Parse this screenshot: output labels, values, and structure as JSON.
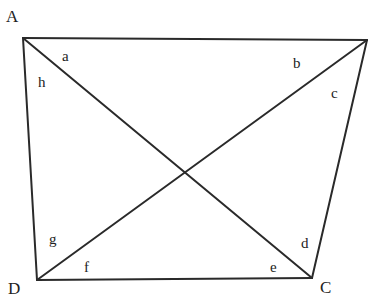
{
  "diagram": {
    "type": "quadrilateral-with-diagonals",
    "vertices": [
      {
        "name": "A",
        "x": 23,
        "y": 38,
        "label_x": 6,
        "label_y": 22
      },
      {
        "name": "B",
        "x": 367,
        "y": 40
      },
      {
        "name": "C",
        "x": 312,
        "y": 278,
        "label_x": 320,
        "label_y": 292
      },
      {
        "name": "D",
        "x": 37,
        "y": 280,
        "label_x": 10,
        "label_y": 293
      }
    ],
    "vertex_labels": {
      "A": "A",
      "C": "C",
      "D": "D"
    },
    "angle_labels": {
      "a": {
        "text": "a",
        "x": 62,
        "y": 61
      },
      "b": {
        "text": "b",
        "x": 295,
        "y": 68
      },
      "c": {
        "text": "c",
        "x": 331,
        "y": 98
      },
      "d": {
        "text": "d",
        "x": 301,
        "y": 248
      },
      "e": {
        "text": "e",
        "x": 271,
        "y": 272
      },
      "f": {
        "text": "f",
        "x": 84,
        "y": 271
      },
      "g": {
        "text": "g",
        "x": 49,
        "y": 244
      },
      "h": {
        "text": "h",
        "x": 39,
        "y": 86
      }
    },
    "stroke_color": "#2a2a2a"
  }
}
